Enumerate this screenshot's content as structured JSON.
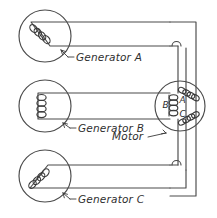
{
  "diagram": {
    "background_color": "#ffffff",
    "line_color": "#4a4a4a",
    "text_color": "#2e2e2e",
    "generators": [
      {
        "id": "a",
        "label": "Generator A",
        "coil_orientation": "diagonal-down-right",
        "coil_turns": 4
      },
      {
        "id": "b",
        "label": "Generator B",
        "coil_orientation": "vertical",
        "coil_turns": 4
      },
      {
        "id": "c",
        "label": "Generator C",
        "coil_orientation": "diagonal-up-right",
        "coil_turns": 4
      }
    ],
    "motor": {
      "label": "Motor",
      "phase_labels": [
        {
          "id": "a",
          "text": "A",
          "position": "upper-right"
        },
        {
          "id": "b",
          "text": "B",
          "position": "left"
        },
        {
          "id": "c",
          "text": "C",
          "position": "lower-right"
        }
      ],
      "coil_count": 3
    },
    "wire_hops": [
      {
        "id": "top",
        "description": "wire crossover bridge above motor"
      },
      {
        "id": "bottom",
        "description": "wire crossover bridge below motor"
      }
    ]
  }
}
